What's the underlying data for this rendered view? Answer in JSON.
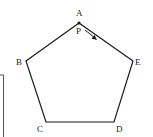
{
  "diagram": {
    "type": "regular-pentagon",
    "stroke_color": "#1a1a1a",
    "vertices": [
      {
        "id": "A",
        "label": "A"
      },
      {
        "id": "B",
        "label": "B"
      },
      {
        "id": "C",
        "label": "C"
      },
      {
        "id": "D",
        "label": "D"
      },
      {
        "id": "E",
        "label": "E"
      }
    ],
    "moving_point": {
      "label": "P",
      "direction": "A-to-E"
    }
  }
}
